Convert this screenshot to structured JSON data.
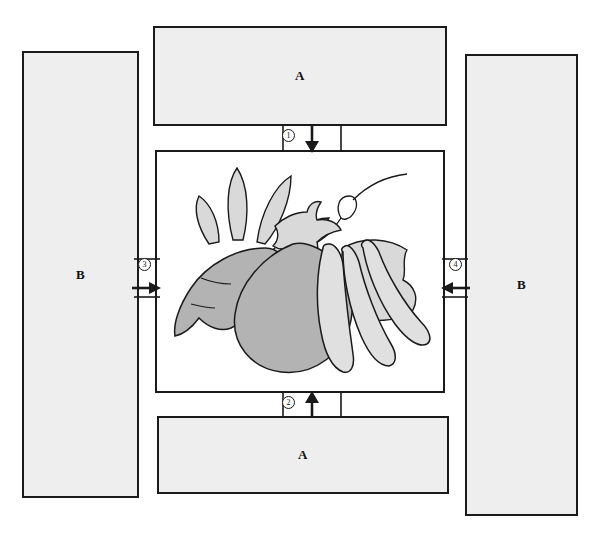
{
  "diagram": {
    "boxes": [
      {
        "id": "a-top",
        "label": "A",
        "position": "top",
        "fill": "#eeeeee",
        "stroke": "#1a1a1a"
      },
      {
        "id": "a-bottom",
        "label": "A",
        "position": "bottom",
        "fill": "#eeeeee",
        "stroke": "#1a1a1a"
      },
      {
        "id": "b-left",
        "label": "B",
        "position": "left",
        "fill": "#eeeeee",
        "stroke": "#1a1a1a"
      },
      {
        "id": "b-right",
        "label": "B",
        "position": "right",
        "fill": "#eeeeee",
        "stroke": "#1a1a1a"
      }
    ],
    "connectors": [
      {
        "id": "1",
        "marker": "1",
        "direction": "down",
        "from": "a-top",
        "to": "image-frame"
      },
      {
        "id": "2",
        "marker": "2",
        "direction": "up",
        "from": "a-bottom",
        "to": "image-frame"
      },
      {
        "id": "3",
        "marker": "3",
        "direction": "right",
        "from": "b-left",
        "to": "image-frame"
      },
      {
        "id": "4",
        "marker": "4",
        "direction": "left",
        "from": "b-right",
        "to": "image-frame"
      }
    ],
    "image_frame": {
      "name": "vegetable-illustration",
      "description": "Line-art illustration of assorted vegetables: a carrot with leafy green top, a tomato/eggplant with stem and curling tendril, a leaf, and green bean pods",
      "border_color": "#1a1a1a",
      "background": "#ffffff",
      "elements": [
        {
          "name": "carrot",
          "fill": "#b3b3b3"
        },
        {
          "name": "carrot-leaves",
          "fill": "#d9d9d9"
        },
        {
          "name": "tomato",
          "fill": "#b3b3b3"
        },
        {
          "name": "tomato-stem",
          "fill": "#d9d9d9"
        },
        {
          "name": "tendril",
          "fill": "none"
        },
        {
          "name": "leaf",
          "fill": "#d9d9d9"
        },
        {
          "name": "bean-pods",
          "fill": "#e0e0e0"
        }
      ]
    },
    "colors": {
      "line": "#1a1a1a",
      "box_fill": "#eeeeee",
      "veg_dark": "#b3b3b3",
      "veg_mid": "#d9d9d9",
      "veg_light": "#e0e0e0",
      "page_background": "#ffffff"
    }
  }
}
